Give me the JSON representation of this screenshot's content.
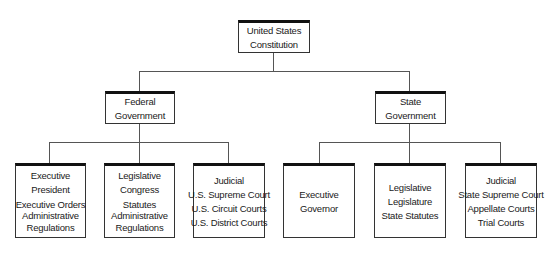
{
  "root": {
    "lines": [
      "United States",
      "Constitution"
    ]
  },
  "federal": {
    "lines": [
      "Federal",
      "Government"
    ],
    "children": [
      {
        "lines": [
          "Executive",
          "President",
          "Executive Orders",
          "Administrative",
          "Regulations"
        ]
      },
      {
        "lines": [
          "Legislative",
          "Congress",
          "Statutes",
          "Administrative",
          "Regulations"
        ]
      },
      {
        "lines": [
          "Judicial",
          "U.S. Supreme Court",
          "U.S. Circuit Courts",
          "U.S. District Courts"
        ]
      }
    ]
  },
  "state": {
    "lines": [
      "State",
      "Government"
    ],
    "children": [
      {
        "lines": [
          "Executive",
          "Governor"
        ]
      },
      {
        "lines": [
          "Legislative",
          "Legislature",
          "State Statutes"
        ]
      },
      {
        "lines": [
          "Judicial",
          "State Supreme Court",
          "Appellate Courts",
          "Trial Courts"
        ]
      }
    ]
  }
}
